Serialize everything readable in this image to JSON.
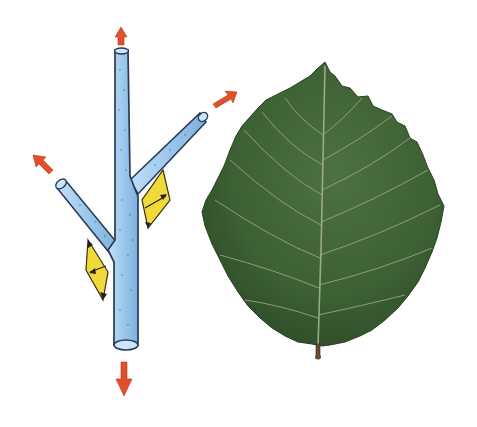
{
  "figure": {
    "colors": {
      "background": "#ffffff",
      "twig_fill": "#9cc8ec",
      "twig_outline": "#2a3a55",
      "arrow": "#e0502a",
      "bud_scale": "#f2d93a",
      "leaf_dark": "#2f4f2a",
      "leaf_mid": "#4a6e3c",
      "leaf_vein": "#9aab86",
      "petiole": "#6a4a32"
    },
    "elements": [
      {
        "name": "twig",
        "arrows": 4,
        "yellow_scales": 2
      },
      {
        "name": "leaf",
        "secondary_vein_pairs": 7
      }
    ]
  }
}
